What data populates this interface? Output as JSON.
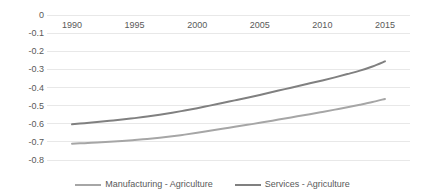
{
  "chart_data": {
    "type": "line",
    "title": "",
    "subtitle": "",
    "xlabel": "",
    "ylabel": "",
    "xlim": [
      1988,
      2017
    ],
    "ylim": [
      -0.8,
      0.0
    ],
    "grid": true,
    "grid_axis": "y",
    "legend_position": "bottom",
    "x_tick_labels": [
      "1990",
      "1995",
      "2000",
      "2005",
      "2010",
      "2015"
    ],
    "x_ticks": [
      1990,
      1995,
      2000,
      2005,
      2010,
      2015
    ],
    "y_tick_labels": [
      "0",
      "-0.1",
      "-0.2",
      "-0.3",
      "-0.4",
      "-0.5",
      "-0.6",
      "-0.7",
      "-0.8"
    ],
    "y_ticks": [
      0,
      -0.1,
      -0.2,
      -0.3,
      -0.4,
      -0.5,
      -0.6,
      -0.7,
      -0.8
    ],
    "x": [
      1990,
      1991,
      1992,
      1993,
      1994,
      1995,
      1996,
      1997,
      1998,
      1999,
      2000,
      2001,
      2002,
      2003,
      2004,
      2005,
      2006,
      2007,
      2008,
      2009,
      2010,
      2011,
      2012,
      2013,
      2014,
      2015
    ],
    "series": [
      {
        "name": "Manufacturing - Agriculture",
        "color": "#A6A6A6",
        "values": [
          -0.71,
          -0.707,
          -0.703,
          -0.699,
          -0.695,
          -0.69,
          -0.684,
          -0.677,
          -0.669,
          -0.66,
          -0.65,
          -0.639,
          -0.628,
          -0.617,
          -0.606,
          -0.595,
          -0.583,
          -0.571,
          -0.559,
          -0.547,
          -0.535,
          -0.522,
          -0.509,
          -0.495,
          -0.48,
          -0.463
        ]
      },
      {
        "name": "Services - Agriculture",
        "color": "#808080",
        "values": [
          -0.603,
          -0.597,
          -0.591,
          -0.584,
          -0.577,
          -0.569,
          -0.56,
          -0.55,
          -0.539,
          -0.527,
          -0.514,
          -0.5,
          -0.486,
          -0.471,
          -0.456,
          -0.441,
          -0.425,
          -0.409,
          -0.393,
          -0.377,
          -0.361,
          -0.344,
          -0.326,
          -0.307,
          -0.284,
          -0.256
        ]
      }
    ]
  },
  "legend": {
    "entries": [
      {
        "label": "Manufacturing - Agriculture",
        "color": "#A6A6A6"
      },
      {
        "label": "Services - Agriculture",
        "color": "#808080"
      }
    ]
  },
  "style": {
    "grid_color": "#E8E8E8",
    "tick_text_color": "#595959",
    "background": "#FFFFFF"
  }
}
